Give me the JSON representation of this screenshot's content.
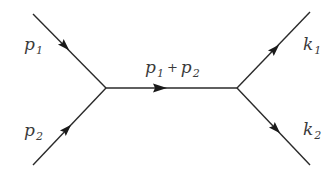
{
  "diagram": {
    "labels": {
      "p1": {
        "symbol": "p",
        "sub": "1"
      },
      "p2": {
        "symbol": "p",
        "sub": "2"
      },
      "k1": {
        "symbol": "k",
        "sub": "1"
      },
      "k2": {
        "symbol": "k",
        "sub": "2"
      },
      "propagator": {
        "a_symbol": "p",
        "a_sub": "1",
        "operator": "+",
        "b_symbol": "p",
        "b_sub": "2"
      }
    },
    "colors": {
      "line": "#2a2a2a",
      "arrow": "#1a1a1a",
      "text": "#3a3a3a",
      "background": "#ffffff"
    }
  }
}
